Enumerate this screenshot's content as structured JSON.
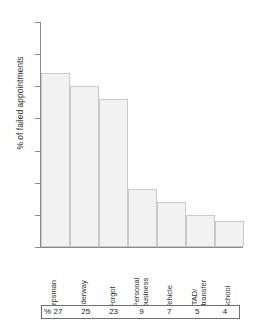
{
  "chart_data": {
    "type": "bar",
    "title": "",
    "xlabel": "",
    "ylabel": "% of failed appointments",
    "ylim": [
      0,
      35
    ],
    "ytick_step": 5,
    "yticks": [
      35,
      30,
      25,
      20,
      15,
      10,
      5,
      0
    ],
    "grid": false,
    "legend": "none",
    "categories": [
      "Corpsman",
      "Underway",
      "Forgot",
      "Personal business",
      "Vehicle",
      "TAD/ transfer",
      "School"
    ],
    "values": [
      27,
      25,
      23,
      9,
      7,
      5,
      4
    ],
    "value_unit": "%",
    "bar_fill": "#f2f2f2",
    "bar_edge": "#c9c9c9",
    "axis_color": "#8a8a8a"
  },
  "axis": {
    "y_title": "% of failed appointments",
    "tick_labels": [
      "35",
      "30",
      "25",
      "20",
      "15",
      "10",
      "5",
      "0"
    ]
  },
  "categories": [
    {
      "line1": "Corpsman",
      "line2": ""
    },
    {
      "line1": "Underway",
      "line2": ""
    },
    {
      "line1": "Forgot",
      "line2": ""
    },
    {
      "line1": "Personal",
      "line2": "business"
    },
    {
      "line1": "Vehicle",
      "line2": ""
    },
    {
      "line1": "TAD/",
      "line2": "transfer"
    },
    {
      "line1": "School",
      "line2": ""
    }
  ],
  "table": {
    "row_label": "%",
    "values": [
      "27",
      "25",
      "23",
      "9",
      "7",
      "5",
      "4"
    ]
  }
}
